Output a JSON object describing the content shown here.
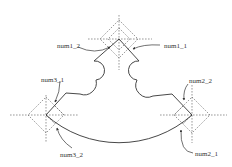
{
  "diagram": {
    "type": "geometric-construction",
    "colors": {
      "stroke": "#333333",
      "dashed": "#555555",
      "background": "#ffffff"
    },
    "nodes": [
      {
        "id": "num1",
        "center": [
          119,
          39
        ],
        "labels": [
          "num1_2",
          "num1_1"
        ]
      },
      {
        "id": "num2",
        "center": [
          192,
          115
        ],
        "labels": [
          "num2_2",
          "num2_1"
        ]
      },
      {
        "id": "num3",
        "center": [
          46,
          115
        ],
        "labels": [
          "num3_1",
          "num3_2"
        ]
      }
    ],
    "labels": {
      "num1_1": "num1_1",
      "num1_2": "num1_2",
      "num2_1": "num2_1",
      "num2_2": "num2_2",
      "num3_1": "num3_1",
      "num3_2": "num3_2"
    }
  }
}
